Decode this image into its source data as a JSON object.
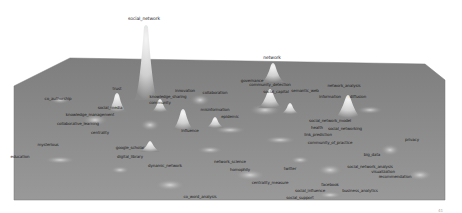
{
  "view": {
    "type": "3d-density-landscape",
    "surface_color": "#8a8a8a",
    "surface_edge_color": "#7a7a7a",
    "peak_color": "#e9e9e9",
    "background": "#ffffff"
  },
  "surface_polygon": "14,86 70,58 425,64 445,80 445,200 14,200",
  "peaks": [
    {
      "id": "social_network",
      "cx": 146,
      "top": 24,
      "base": 100,
      "w": 16,
      "h": 76
    },
    {
      "id": "network",
      "cx": 273,
      "top": 62,
      "base": 82,
      "w": 14,
      "h": 20
    },
    {
      "id": "network_analysis",
      "cx": 348,
      "top": 94,
      "base": 118,
      "w": 18,
      "h": 24
    },
    {
      "id": "trust",
      "cx": 117,
      "top": 92,
      "base": 112,
      "w": 12,
      "h": 20
    },
    {
      "id": "social_capital",
      "cx": 270,
      "top": 88,
      "base": 108,
      "w": 16,
      "h": 20
    },
    {
      "id": "community",
      "cx": 160,
      "top": 98,
      "base": 112,
      "w": 10,
      "h": 14
    },
    {
      "id": "influence",
      "cx": 183,
      "top": 108,
      "base": 130,
      "w": 14,
      "h": 22
    },
    {
      "id": "blob_a",
      "cx": 215,
      "top": 116,
      "base": 128,
      "w": 10,
      "h": 12
    },
    {
      "id": "blob_b",
      "cx": 290,
      "top": 102,
      "base": 114,
      "w": 10,
      "h": 12
    },
    {
      "id": "blob_c",
      "cx": 150,
      "top": 140,
      "base": 152,
      "w": 12,
      "h": 12
    }
  ],
  "labels": [
    {
      "text": "social_network",
      "x": 144,
      "y": 17,
      "top": true
    },
    {
      "text": "network",
      "x": 272,
      "y": 56,
      "top": true
    },
    {
      "text": "network_analysis",
      "x": 344,
      "y": 84
    },
    {
      "text": "co_authorship",
      "x": 58,
      "y": 97
    },
    {
      "text": "trust",
      "x": 117,
      "y": 87
    },
    {
      "text": "social_capital",
      "x": 276,
      "y": 90
    },
    {
      "text": "community_detection",
      "x": 270,
      "y": 83
    },
    {
      "text": "governance",
      "x": 252,
      "y": 79
    },
    {
      "text": "semantic_web",
      "x": 305,
      "y": 89
    },
    {
      "text": "information",
      "x": 330,
      "y": 95
    },
    {
      "text": "diffusion",
      "x": 358,
      "y": 95
    },
    {
      "text": "innovation",
      "x": 185,
      "y": 89
    },
    {
      "text": "collaboration",
      "x": 215,
      "y": 91
    },
    {
      "text": "knowledge_sharing",
      "x": 168,
      "y": 95
    },
    {
      "text": "social_media",
      "x": 110,
      "y": 106
    },
    {
      "text": "knowledge_management",
      "x": 90,
      "y": 113
    },
    {
      "text": "collaborative_learning",
      "x": 78,
      "y": 122
    },
    {
      "text": "centrality",
      "x": 100,
      "y": 131
    },
    {
      "text": "influence",
      "x": 190,
      "y": 129
    },
    {
      "text": "social_network_model",
      "x": 330,
      "y": 119
    },
    {
      "text": "health",
      "x": 317,
      "y": 126
    },
    {
      "text": "social_networking",
      "x": 345,
      "y": 127
    },
    {
      "text": "link_prediction",
      "x": 318,
      "y": 133
    },
    {
      "text": "community_of_practice",
      "x": 330,
      "y": 141
    },
    {
      "text": "privacy",
      "x": 412,
      "y": 138
    },
    {
      "text": "big_data",
      "x": 372,
      "y": 153
    },
    {
      "text": "mysterious",
      "x": 48,
      "y": 143
    },
    {
      "text": "education",
      "x": 20,
      "y": 155
    },
    {
      "text": "google_scholar",
      "x": 130,
      "y": 146
    },
    {
      "text": "digital_library",
      "x": 130,
      "y": 155
    },
    {
      "text": "dynamic_network",
      "x": 165,
      "y": 164
    },
    {
      "text": "network_science",
      "x": 230,
      "y": 160
    },
    {
      "text": "homophily",
      "x": 240,
      "y": 168
    },
    {
      "text": "centrality_measure",
      "x": 270,
      "y": 181
    },
    {
      "text": "social_network_analysis",
      "x": 370,
      "y": 165
    },
    {
      "text": "visualization",
      "x": 383,
      "y": 170
    },
    {
      "text": "recommendation",
      "x": 395,
      "y": 175
    },
    {
      "text": "facebook",
      "x": 330,
      "y": 183
    },
    {
      "text": "social_influence",
      "x": 310,
      "y": 189
    },
    {
      "text": "business_analytics",
      "x": 360,
      "y": 189
    },
    {
      "text": "social_support",
      "x": 300,
      "y": 196
    },
    {
      "text": "co_word_analysis",
      "x": 200,
      "y": 195
    },
    {
      "text": "twitter",
      "x": 290,
      "y": 167
    },
    {
      "text": "misinformation",
      "x": 215,
      "y": 108
    },
    {
      "text": "community",
      "x": 160,
      "y": 101
    },
    {
      "text": "epidemic",
      "x": 230,
      "y": 115
    }
  ],
  "page_marker": {
    "text": "41",
    "x": 438,
    "y": 208
  }
}
